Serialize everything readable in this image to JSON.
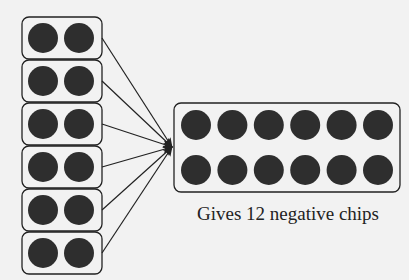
{
  "diagram": {
    "type": "chip-model",
    "left_groups": {
      "count": 6,
      "chips_per_group": 2,
      "chip_color": "#2e2e2e"
    },
    "result_group": {
      "rows": 2,
      "cols": 6,
      "chip_color": "#2e2e2e"
    },
    "caption": "Gives 12 negative chips",
    "colors": {
      "background": "#f2f2f2",
      "stroke": "#222222",
      "chip": "#2e2e2e"
    }
  }
}
